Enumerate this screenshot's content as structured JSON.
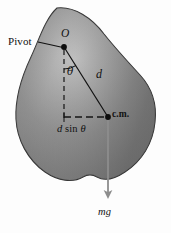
{
  "figure": {
    "background_color": "#fdfdfd",
    "body_fill_dark": "#6f6f6f",
    "body_fill_light": "#b9b9b9",
    "outline_color": "#2b2b2b",
    "line_color": "#111111",
    "gray_arrow_color": "#8d8d8d"
  },
  "labels": {
    "pivot": "Pivot",
    "origin": "O",
    "theta": "θ",
    "distance": "d",
    "center_of_mass": "c.m.",
    "moment_arm_prefix": "d",
    "moment_arm_sin": "sin",
    "moment_arm_theta": "θ",
    "moment_arm_full": "d sin θ",
    "weight": "mg"
  },
  "caption": {
    "text": ""
  },
  "geometry": {
    "pivot_point": {
      "x": 64,
      "y": 47
    },
    "center_of_mass_point": {
      "x": 108,
      "y": 117
    },
    "vertical_dashed_end": {
      "x": 64,
      "y": 117
    },
    "weight_arrow_end": {
      "x": 108,
      "y": 203
    },
    "leader_line_start": {
      "x": 38,
      "y": 42
    },
    "angle_arc_radius": 22
  }
}
